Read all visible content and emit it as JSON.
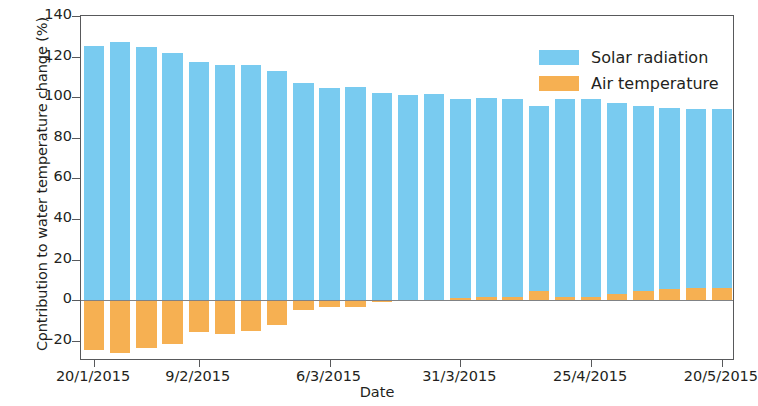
{
  "chart_data": {
    "type": "bar",
    "stacked": true,
    "title": "",
    "xlabel": "Date",
    "ylabel": "Contribution to water temperature change (%)",
    "ylim": [
      -30,
      140
    ],
    "yticks": [
      -20,
      0,
      20,
      40,
      60,
      80,
      100,
      120,
      140
    ],
    "ytick_labels": [
      "−20",
      "0",
      "20",
      "40",
      "60",
      "80",
      "100",
      "120",
      "140"
    ],
    "grid": false,
    "legend_position": "upper right",
    "xtick_labels": [
      "20/1/2015",
      "9/2/2015",
      "6/3/2015",
      "31/3/2015",
      "25/4/2015",
      "20/5/2015"
    ],
    "xtick_indices": [
      0,
      4,
      9,
      14,
      19,
      24
    ],
    "categories": [
      "20/1/2015",
      "25/1/2015",
      "30/1/2015",
      "4/2/2015",
      "9/2/2015",
      "14/2/2015",
      "19/2/2015",
      "24/2/2015",
      "1/3/2015",
      "6/3/2015",
      "11/3/2015",
      "16/3/2015",
      "21/3/2015",
      "26/3/2015",
      "31/3/2015",
      "5/4/2015",
      "10/4/2015",
      "15/4/2015",
      "20/4/2015",
      "25/4/2015",
      "30/4/2015",
      "5/5/2015",
      "10/5/2015",
      "15/5/2015",
      "20/5/2015"
    ],
    "series": [
      {
        "name": "Solar radiation",
        "color": "#79cbf0",
        "values": [
          125,
          127,
          124.5,
          122,
          117.5,
          116,
          116,
          113,
          107,
          104.5,
          105,
          102,
          101,
          101.5,
          99,
          99.5,
          99,
          95.5,
          99,
          99,
          97,
          95.5,
          94.5,
          94,
          94
        ]
      },
      {
        "name": "Air temperature",
        "color": "#f6b052",
        "values": [
          -24.5,
          -26,
          -23.5,
          -21.5,
          -15.5,
          -16.5,
          -15,
          -12.5,
          -5,
          -3.5,
          -3.5,
          -1,
          -0.5,
          -0.5,
          1,
          1.5,
          1.5,
          4.5,
          1.5,
          1.5,
          3,
          4.5,
          5.5,
          6,
          6
        ]
      }
    ]
  },
  "legend": {
    "items": [
      {
        "label": "Solar radiation",
        "color": "#79cbf0"
      },
      {
        "label": "Air temperature",
        "color": "#f6b052"
      }
    ]
  }
}
